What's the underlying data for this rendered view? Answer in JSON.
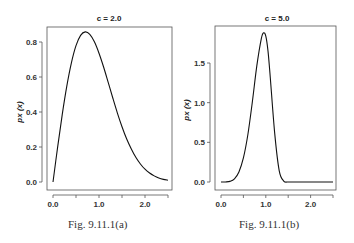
{
  "chart_data": [
    {
      "type": "line",
      "title": "c = 2.0",
      "xlabel": "",
      "ylabel": "px (x)",
      "caption": "Fig.  9.11.1(a)",
      "xlim": [
        0,
        2.5
      ],
      "ylim": [
        0,
        0.86
      ],
      "xticks": [
        "0.0",
        "1.0",
        "2.0"
      ],
      "xticks_minor": [
        0.5,
        1.5,
        2.5
      ],
      "yticks": [
        "0.0",
        "0.2",
        "0.4",
        "0.6",
        "0.8"
      ],
      "grid": false,
      "x": [
        0.0,
        0.1,
        0.2,
        0.3,
        0.4,
        0.5,
        0.6,
        0.7,
        0.8,
        0.9,
        1.0,
        1.1,
        1.2,
        1.3,
        1.4,
        1.5,
        1.6,
        1.7,
        1.8,
        1.9,
        2.0,
        2.1,
        2.2,
        2.3,
        2.4,
        2.5
      ],
      "values": [
        0.0,
        0.198,
        0.384,
        0.548,
        0.681,
        0.779,
        0.838,
        0.858,
        0.844,
        0.801,
        0.736,
        0.657,
        0.569,
        0.48,
        0.394,
        0.316,
        0.247,
        0.19,
        0.141,
        0.103,
        0.073,
        0.051,
        0.035,
        0.023,
        0.015,
        0.01
      ]
    },
    {
      "type": "line",
      "title": "c = 5.0",
      "xlabel": "",
      "ylabel": "px (x)",
      "caption": "Fig.  9.11.1(b)",
      "xlim": [
        0,
        2.5
      ],
      "ylim": [
        0,
        1.9
      ],
      "xticks": [
        "0.0",
        "1.0",
        "2.0"
      ],
      "xticks_minor": [
        0.5,
        1.5,
        2.5
      ],
      "yticks": [
        "0.0",
        "0.5",
        "1.0",
        "1.5"
      ],
      "grid": false,
      "x": [
        0.0,
        0.1,
        0.2,
        0.3,
        0.4,
        0.5,
        0.6,
        0.7,
        0.8,
        0.9,
        0.95,
        1.0,
        1.05,
        1.1,
        1.2,
        1.3,
        1.4,
        1.5,
        1.6,
        1.7,
        2.0,
        2.5
      ],
      "values": [
        0.0,
        0.0005,
        0.008,
        0.04,
        0.127,
        0.303,
        0.599,
        1.011,
        1.466,
        1.808,
        1.88,
        1.839,
        1.647,
        1.318,
        0.606,
        0.141,
        0.012,
        0.0,
        0.0,
        0.0,
        0.0,
        0.0
      ]
    }
  ],
  "panels": [
    {
      "title": "c = 2.0",
      "ylabel": "px (x)",
      "caption": "Fig.  9.11.1(a)"
    },
    {
      "title": "c = 5.0",
      "ylabel": "px (x)",
      "caption": "Fig.  9.11.1(b)"
    }
  ]
}
